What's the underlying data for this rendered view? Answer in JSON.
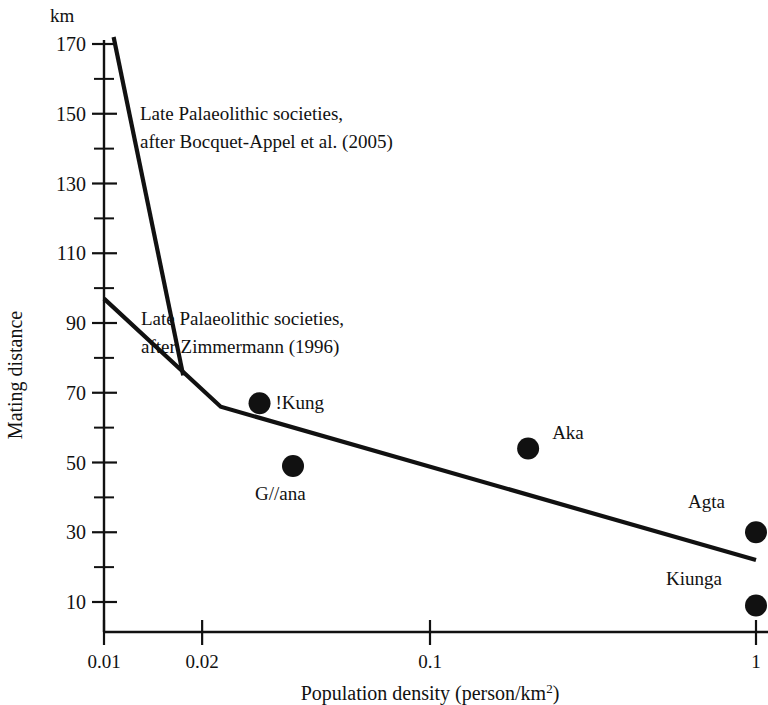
{
  "chart_data": {
    "type": "scatter",
    "title": "",
    "xlabel": "Population density (person/km2)",
    "xlabel_base": "Population density (person/km",
    "xlabel_sup": "2",
    "xlabel_tail": ")",
    "ylabel": "Mating distance",
    "yunit": "km",
    "xscale": "log",
    "xlim": [
      0.01,
      1.0
    ],
    "ylim": [
      0,
      175
    ],
    "grid": false,
    "legend": "none",
    "xticks": [
      0.01,
      0.02,
      0.1,
      1
    ],
    "xtick_labels": [
      "0.01",
      "0.02",
      "0.1",
      "1"
    ],
    "yticks": [
      10,
      30,
      50,
      70,
      90,
      110,
      130,
      150,
      170
    ],
    "ytick_labels": [
      "10",
      "30",
      "50",
      "70",
      "90",
      "110",
      "130",
      "150",
      "170"
    ],
    "yticks_minor": [
      20,
      40,
      60,
      80,
      100,
      120,
      140,
      160
    ],
    "points": [
      {
        "label": "!Kung",
        "x": 0.03,
        "y": 67,
        "label_dx": 16,
        "label_dy": 6
      },
      {
        "label": "G//ana",
        "x": 0.038,
        "y": 49,
        "label_dx": -38,
        "label_dy": 34
      },
      {
        "label": "Aka",
        "x": 0.2,
        "y": 54,
        "label_dx": 24,
        "label_dy": -10
      },
      {
        "label": "Agta",
        "x": 1.0,
        "y": 30,
        "label_dx": -68,
        "label_dy": -24
      },
      {
        "label": "Kiunga",
        "x": 1.0,
        "y": 9,
        "label_dx": -90,
        "label_dy": -20
      }
    ],
    "series": [
      {
        "name": "Late Palaeolithic societies, after Bocquet-Appel et al. (2005)",
        "type": "line",
        "points": [
          [
            0.0107,
            172
          ],
          [
            0.0175,
            75
          ]
        ]
      },
      {
        "name": "Late Palaeolithic societies, after Zimmermann (1996)",
        "type": "line",
        "points": [
          [
            0.01,
            97
          ],
          [
            0.0228,
            66
          ],
          [
            1.0,
            22
          ]
        ]
      }
    ],
    "annotations": [
      {
        "id": "bocquet",
        "line1": "Late Palaeolithic societies,",
        "line2": "after Bocquet-Appel et al. (2005)",
        "x": 140,
        "y": 120
      },
      {
        "id": "zimmermann",
        "line1": "Late Palaeolithic societies,",
        "line2": "after Zimmermann (1996)",
        "x": 141,
        "y": 325
      }
    ]
  },
  "axes": {
    "x_axis_y_px": 632,
    "y_axis_x_px": 104,
    "x_left_px": 104,
    "x_right_px": 756,
    "y_top_px": 44,
    "y_bottom_px": 602
  }
}
